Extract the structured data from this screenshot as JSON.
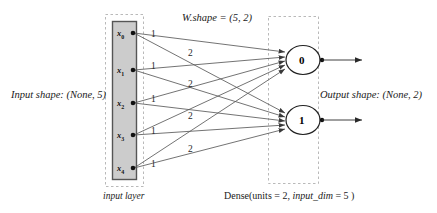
{
  "diagram": {
    "labels": {
      "input_shape": "Input shape: (None, 5)",
      "output_shape": "Output shape: (None, 2)",
      "w_shape": "W.shape = (5, 2)",
      "input_layer": "input layer",
      "dense_prefix": "Dense(units = 2,  ",
      "dense_italic": "input_dim",
      "dense_suffix": " = 5 )"
    },
    "input_layer": {
      "name": "input layer",
      "node_count": 5,
      "nodes": [
        {
          "label": "x",
          "sub": "0",
          "y": 33
        },
        {
          "label": "x",
          "sub": "1",
          "y": 70
        },
        {
          "label": "x",
          "sub": "2",
          "y": 103
        },
        {
          "label": "x",
          "sub": "3",
          "y": 135
        },
        {
          "label": "x",
          "sub": "4",
          "y": 168
        }
      ],
      "box": {
        "x": 112,
        "y": 21,
        "width": 24,
        "height": 158,
        "fill": "#cccccc",
        "stroke": "#555555"
      },
      "dashed_box": {
        "x": 105,
        "y": 14,
        "width": 38,
        "height": 172
      }
    },
    "dense_layer": {
      "name": "Dense",
      "units": 2,
      "input_dim": 5,
      "neurons": [
        {
          "label": "0",
          "cx": 303,
          "cy": 60
        },
        {
          "label": "1",
          "cx": 303,
          "cy": 120
        }
      ],
      "dashed_box": {
        "x": 268,
        "y": 16,
        "width": 50,
        "height": 167
      }
    },
    "weights": {
      "shape": [
        5,
        2
      ],
      "column_labels": [
        "1",
        "2"
      ],
      "label_positions": [
        {
          "text": "1",
          "x": 151,
          "y": 30
        },
        {
          "text": "2",
          "x": 188,
          "y": 49
        },
        {
          "text": "1",
          "x": 151,
          "y": 62
        },
        {
          "text": "2",
          "x": 188,
          "y": 80
        },
        {
          "text": "1",
          "x": 151,
          "y": 95
        },
        {
          "text": "2",
          "x": 188,
          "y": 112
        },
        {
          "text": "1",
          "x": 151,
          "y": 127
        },
        {
          "text": "2",
          "x": 188,
          "y": 145
        },
        {
          "text": "1",
          "x": 151,
          "y": 160
        }
      ]
    },
    "colors": {
      "edge": "#555555",
      "box_fill": "#cccccc",
      "box_stroke": "#555555",
      "dashed": "#b5b5b5",
      "text": "#1a1a1a",
      "background": "#ffffff"
    }
  }
}
